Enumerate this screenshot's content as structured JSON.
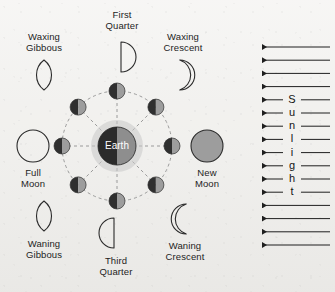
{
  "diagram": {
    "background_color": "#f2f1ee",
    "ink_color": "#1d1d1d",
    "center_body": {
      "name": "Earth",
      "label": "Earth",
      "cx": 117,
      "cy": 146,
      "r": 19,
      "dark_color": "#2b2b2b",
      "lit_color": "#8e8e8e",
      "halo_color": "#c9c9c9",
      "halo_r": 26
    },
    "orbit": {
      "radius": 55,
      "stroke_color": "#9a9a9a",
      "dash": "3 3",
      "spokes": 8
    },
    "orbit_moons": [
      {
        "name": "orbit-moon-first-quarter",
        "angle_deg": 270,
        "r": 8
      },
      {
        "name": "orbit-moon-waxing-gibbous",
        "angle_deg": 315,
        "r": 8
      },
      {
        "name": "orbit-moon-full",
        "angle_deg": 0,
        "r": 8
      },
      {
        "name": "orbit-moon-waning-gibbous",
        "angle_deg": 45,
        "r": 8
      },
      {
        "name": "orbit-moon-third-quarter",
        "angle_deg": 90,
        "r": 8
      },
      {
        "name": "orbit-moon-waning-crescent",
        "angle_deg": 135,
        "r": 8
      },
      {
        "name": "orbit-moon-new",
        "angle_deg": 180,
        "r": 8
      },
      {
        "name": "orbit-moon-waxing-crescent",
        "angle_deg": 225,
        "r": 8
      }
    ],
    "orbit_moon_colors": {
      "dark": "#2f2f2f",
      "lit": "#9d9d9d"
    },
    "phases": [
      {
        "key": "first_quarter",
        "label_line1": "First",
        "label_line2": "Quarter",
        "shape": "half-right",
        "icon_cx": 121,
        "icon_cy": 57,
        "icon_r": 15,
        "label_x": 87,
        "label_y": 9,
        "label_w": 70
      },
      {
        "key": "waxing_gibbous",
        "label_line1": "Waxing",
        "label_line2": "Gibbous",
        "shape": "gibbous-lens",
        "icon_cx": 44,
        "icon_cy": 75,
        "icon_r": 15,
        "label_x": 9,
        "label_y": 31,
        "label_w": 70
      },
      {
        "key": "waxing_crescent",
        "label_line1": "Waxing",
        "label_line2": "Crescent",
        "shape": "crescent-right",
        "icon_cx": 182,
        "icon_cy": 75,
        "icon_r": 15,
        "label_x": 147,
        "label_y": 31,
        "label_w": 72
      },
      {
        "key": "full_moon",
        "label_line1": "Full",
        "label_line2": "Moon",
        "shape": "circle-outline",
        "icon_cx": 33,
        "icon_cy": 146,
        "icon_r": 16,
        "label_x": -2,
        "label_y": 167,
        "label_w": 70
      },
      {
        "key": "new_moon",
        "label_line1": "New",
        "label_line2": "Moon",
        "shape": "circle-filled",
        "icon_cx": 207,
        "icon_cy": 146,
        "icon_r": 16,
        "label_x": 172,
        "label_y": 167,
        "label_w": 70,
        "fill_color": "#9d9d9d"
      },
      {
        "key": "waning_gibbous",
        "label_line1": "Waning",
        "label_line2": "Gibbous",
        "shape": "gibbous-lens",
        "icon_cx": 44,
        "icon_cy": 216,
        "icon_r": 15,
        "label_x": 9,
        "label_y": 238,
        "label_w": 70
      },
      {
        "key": "third_quarter",
        "label_line1": "Third",
        "label_line2": "Quarter",
        "shape": "half-left",
        "icon_cx": 114,
        "icon_cy": 233,
        "icon_r": 15,
        "label_x": 81,
        "label_y": 255,
        "label_w": 70
      },
      {
        "key": "waning_crescent",
        "label_line1": "Waning",
        "label_line2": "Crescent",
        "shape": "crescent-left",
        "icon_cx": 184,
        "icon_cy": 219,
        "icon_r": 15,
        "label_x": 149,
        "label_y": 240,
        "label_w": 72
      }
    ],
    "sunlight": {
      "word": "Sunlight",
      "letters": [
        "S",
        "u",
        "n",
        "l",
        "i",
        "g",
        "h",
        "t"
      ],
      "arrow_count": 16,
      "lettered_arrow_start_index": 4,
      "direction": "left",
      "x_start": 330,
      "x_end": 262,
      "y_first": 47,
      "y_step": 13.2,
      "stroke_color": "#1f1f1f",
      "letter_x": 292
    }
  }
}
